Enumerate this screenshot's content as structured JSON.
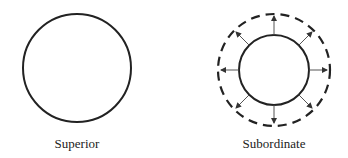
{
  "diagram": {
    "panels": [
      {
        "label": "Superior",
        "shape": "solid-circle"
      },
      {
        "label": "Subordinate",
        "shape": "solid-circle-with-outward-arrows-and-dashed-outer-circle"
      }
    ],
    "colors": {
      "stroke": "#222222",
      "arrow": "#555555",
      "background": "#ffffff"
    }
  }
}
